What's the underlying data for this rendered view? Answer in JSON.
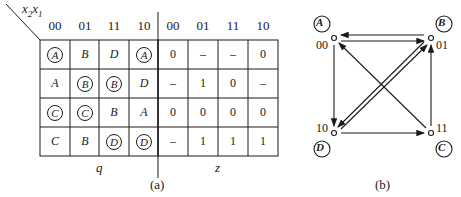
{
  "figure_a": {
    "axis_label": "x2x1",
    "axis_label_main": "x",
    "axis_label_sub1": "2",
    "axis_label_sub2": "1",
    "q_table": {
      "column_headers": [
        "00",
        "01",
        "11",
        "10"
      ],
      "rows": [
        [
          {
            "v": "A",
            "stable": true
          },
          {
            "v": "B",
            "stable": false
          },
          {
            "v": "D",
            "stable": false
          },
          {
            "v": "A",
            "stable": true
          }
        ],
        [
          {
            "v": "A",
            "stable": false
          },
          {
            "v": "B",
            "stable": true
          },
          {
            "v": "B",
            "stable": true
          },
          {
            "v": "D",
            "stable": false
          }
        ],
        [
          {
            "v": "C",
            "stable": true
          },
          {
            "v": "C",
            "stable": true
          },
          {
            "v": "B",
            "stable": false
          },
          {
            "v": "A",
            "stable": false
          }
        ],
        [
          {
            "v": "C",
            "stable": false
          },
          {
            "v": "B",
            "stable": false
          },
          {
            "v": "D",
            "stable": true
          },
          {
            "v": "D",
            "stable": true
          }
        ]
      ],
      "label": "q"
    },
    "z_table": {
      "column_headers": [
        "00",
        "01",
        "11",
        "10"
      ],
      "rows": [
        [
          "0",
          "–",
          "–",
          "0"
        ],
        [
          "–",
          "1",
          "0",
          "–"
        ],
        [
          "0",
          "0",
          "0",
          "0"
        ],
        [
          "–",
          "1",
          "1",
          "1"
        ]
      ],
      "label": "z"
    },
    "caption": "(a)"
  },
  "figure_b": {
    "nodes": [
      {
        "id": "A",
        "code": "00"
      },
      {
        "id": "B",
        "code": "01"
      },
      {
        "id": "C",
        "code": "11"
      },
      {
        "id": "D",
        "code": "10"
      }
    ],
    "edges": [
      {
        "from": "01",
        "to": "00"
      },
      {
        "from": "00",
        "to": "01"
      },
      {
        "from": "00",
        "to": "10"
      },
      {
        "from": "10",
        "to": "11"
      },
      {
        "from": "11",
        "to": "01"
      },
      {
        "from": "11",
        "to": "00"
      },
      {
        "from": "01",
        "to": "10"
      },
      {
        "from": "10",
        "to": "01"
      }
    ],
    "caption": "(b)"
  }
}
